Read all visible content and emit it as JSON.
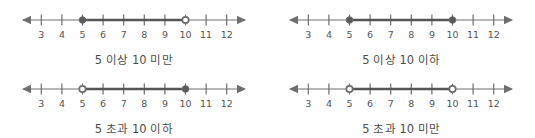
{
  "figure": {
    "type": "number-line-interval-diagrams",
    "panel_count": 4,
    "colors": {
      "background": "#ffffff",
      "axis": "#6e6e6e",
      "segment": "#555555",
      "marker_fill": "#5a5a5a",
      "marker_stroke": "#6b6b6b",
      "marker_open_fill": "#ffffff",
      "tick_label": "#555555",
      "caption": "#4d4d4d"
    },
    "axis": {
      "tick_values": [
        3,
        4,
        5,
        6,
        7,
        8,
        9,
        10,
        11,
        12
      ],
      "tick_labels": [
        "3",
        "4",
        "5",
        "6",
        "7",
        "8",
        "9",
        "10",
        "11",
        "12"
      ],
      "left_arrow": true,
      "right_arrow": true,
      "domain_min": 3,
      "domain_max": 12
    },
    "panels": [
      {
        "id": "panel-1",
        "caption": "5 이상 10 미만",
        "interval": {
          "start": 5,
          "end": 10,
          "start_marker": "filled",
          "end_marker": "open"
        }
      },
      {
        "id": "panel-2",
        "caption": "5 이상 10 이하",
        "interval": {
          "start": 5,
          "end": 10,
          "start_marker": "filled",
          "end_marker": "filled"
        }
      },
      {
        "id": "panel-3",
        "caption": "5 초과 10 이하",
        "interval": {
          "start": 5,
          "end": 10,
          "start_marker": "open",
          "end_marker": "filled"
        }
      },
      {
        "id": "panel-4",
        "caption": "5 초과 10 미만",
        "interval": {
          "start": 5,
          "end": 10,
          "start_marker": "open",
          "end_marker": "open"
        }
      }
    ]
  }
}
